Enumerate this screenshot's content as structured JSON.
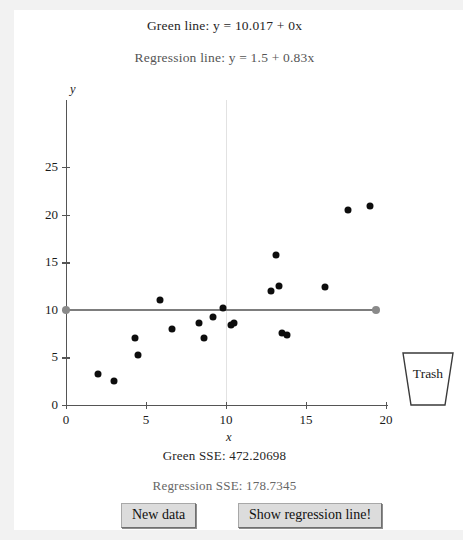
{
  "header": {
    "green_equation": "Green line: y = 10.017 + 0x",
    "regression_equation": "Regression line: y = 1.5 + 0.83x"
  },
  "footer": {
    "green_sse": "Green SSE: 472.20698",
    "regression_sse": "Regression SSE: 178.7345"
  },
  "buttons": {
    "new_data": "New data",
    "show_regression": "Show regression line!"
  },
  "trash": {
    "label": "Trash"
  },
  "colors": {
    "green_line": "#7d7d7d",
    "axis": "#555555",
    "point": "#0d0d0d",
    "handle": "#8a8a8a",
    "panel_background": "#ffffff",
    "page_background": "#f2f2f2"
  },
  "chart_data": {
    "type": "scatter",
    "title": "",
    "xlabel": "x",
    "ylabel": "y",
    "xlim": [
      0,
      20
    ],
    "ylim": [
      0,
      25
    ],
    "xticks": [
      0,
      5,
      10,
      15,
      20
    ],
    "yticks": [
      0,
      5,
      10,
      15,
      20,
      25
    ],
    "grid": false,
    "legend": "none",
    "points": [
      {
        "x": 2.0,
        "y": 3.3
      },
      {
        "x": 3.0,
        "y": 2.5
      },
      {
        "x": 4.3,
        "y": 7.0
      },
      {
        "x": 4.5,
        "y": 5.2
      },
      {
        "x": 5.9,
        "y": 11.0
      },
      {
        "x": 6.6,
        "y": 8.0
      },
      {
        "x": 8.3,
        "y": 8.6
      },
      {
        "x": 8.6,
        "y": 7.0
      },
      {
        "x": 9.2,
        "y": 9.2
      },
      {
        "x": 9.8,
        "y": 10.2
      },
      {
        "x": 10.3,
        "y": 8.4
      },
      {
        "x": 10.5,
        "y": 8.6
      },
      {
        "x": 12.8,
        "y": 12.0
      },
      {
        "x": 13.1,
        "y": 15.8
      },
      {
        "x": 13.3,
        "y": 12.5
      },
      {
        "x": 13.5,
        "y": 7.6
      },
      {
        "x": 13.8,
        "y": 7.4
      },
      {
        "x": 16.2,
        "y": 12.4
      },
      {
        "x": 17.6,
        "y": 20.5
      },
      {
        "x": 19.0,
        "y": 20.9
      }
    ],
    "green_line": {
      "label": "Green line",
      "intercept": 10.017,
      "slope": 0,
      "x_start": 0,
      "x_end": 19.4,
      "sse": 472.20698
    },
    "regression_line": {
      "label": "Regression line",
      "intercept": 1.5,
      "slope": 0.83,
      "sse": 178.7345,
      "visible": false
    },
    "vertical_guide_x": 10
  }
}
